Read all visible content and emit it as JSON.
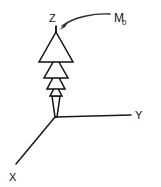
{
  "figure": {
    "name": "magnetization-vector-diagram",
    "background_color": "#ffffff",
    "line_color": "#111111",
    "width": 161,
    "height": 187
  },
  "axes": {
    "origin": {
      "x": 55,
      "y": 117
    },
    "items": [
      {
        "id": "z",
        "label": "Z",
        "label_x": 49,
        "label_y": 22,
        "x1": 55,
        "y1": 117,
        "x2": 56,
        "y2": 26
      },
      {
        "id": "y",
        "label": "Y",
        "label_x": 135,
        "label_y": 118,
        "x1": 55,
        "y1": 117,
        "x2": 131,
        "y2": 115
      },
      {
        "id": "x",
        "label": "X",
        "label_x": 9,
        "label_y": 181,
        "x1": 55,
        "y1": 117,
        "x2": 16,
        "y2": 164
      }
    ]
  },
  "vector": {
    "name": "magnetization-vector",
    "description": "stacked hollow arrowheads along Z axis",
    "tip": {
      "x": 56,
      "y": 26
    },
    "tail": {
      "x": 56,
      "y": 117
    },
    "shaft_top": "M 56 26 L 56 34",
    "arrowheads": [
      {
        "index": 1,
        "apex_y": 32,
        "base_y": 62,
        "half_width": 17
      },
      {
        "index": 2,
        "apex_y": 57,
        "base_y": 78,
        "half_width": 12
      },
      {
        "index": 3,
        "apex_y": 72,
        "base_y": 89,
        "half_width": 9
      },
      {
        "index": 4,
        "apex_y": 85,
        "base_y": 96,
        "half_width": 6
      }
    ],
    "shaft_bottom": {
      "top_y": 96,
      "top_half_width": 4,
      "bottom_y": 117,
      "bottom_half_width": 1
    }
  },
  "callout": {
    "name": "m0-callout",
    "label": "M",
    "subscript": "0",
    "label_x": 114,
    "label_y": 22,
    "curve_path": "M 110 14 C 95 13 74 17 62 26",
    "arrow_head_points": "62,29 68,21 66,25"
  }
}
